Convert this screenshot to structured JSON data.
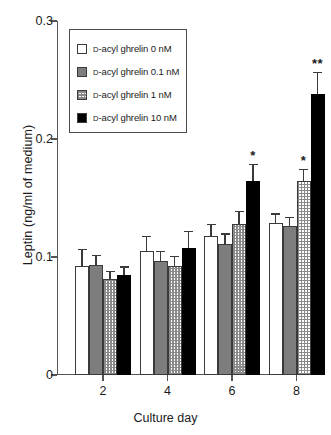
{
  "chart_data": {
    "type": "bar",
    "title": "",
    "xlabel": "Culture day",
    "ylabel": "Leptin (ng/ml of medium)",
    "categories": [
      "2",
      "4",
      "6",
      "8"
    ],
    "ylim": [
      0,
      0.3
    ],
    "yticks": [
      "0",
      "0.1",
      "0.2",
      "0.3"
    ],
    "ytick_values": [
      0,
      0.1,
      0.2,
      0.3
    ],
    "grid": false,
    "legend_position": "upper-left-inside",
    "series": [
      {
        "name": "D-acyl ghrelin 0 nM",
        "fill": "white",
        "values": [
          0.092,
          0.105,
          0.118,
          0.129
        ],
        "errors": [
          0.015,
          0.013,
          0.01,
          0.008
        ],
        "significance": [
          "",
          "",
          "",
          ""
        ]
      },
      {
        "name": "D-acyl ghrelin 0.1 nM",
        "fill": "gray",
        "values": [
          0.093,
          0.097,
          0.111,
          0.126
        ],
        "errors": [
          0.009,
          0.008,
          0.009,
          0.008
        ],
        "significance": [
          "",
          "",
          "",
          ""
        ]
      },
      {
        "name": "D-acyl ghrelin 1 nM",
        "fill": "checker",
        "values": [
          0.081,
          0.092,
          0.128,
          0.164
        ],
        "errors": [
          0.007,
          0.009,
          0.011,
          0.011
        ],
        "significance": [
          "",
          "",
          "",
          "*"
        ]
      },
      {
        "name": "D-acyl ghrelin 10 nM",
        "fill": "black",
        "values": [
          0.085,
          0.108,
          0.164,
          0.238
        ],
        "errors": [
          0.007,
          0.014,
          0.015,
          0.019
        ],
        "significance": [
          "",
          "",
          "*",
          "**"
        ]
      }
    ]
  },
  "legend": {
    "entries": [
      {
        "prefix": "D",
        "label": "-acyl ghrelin 0 nM",
        "swatch": "white"
      },
      {
        "prefix": "D",
        "label": "-acyl ghrelin 0.1 nM",
        "swatch": "gray"
      },
      {
        "prefix": "D",
        "label": "-acyl ghrelin 1 nM",
        "swatch": "checker"
      },
      {
        "prefix": "D",
        "label": "-acyl ghrelin 10 nM",
        "swatch": "black"
      }
    ]
  },
  "axes": {
    "y_label": "Leptin (ng/ml of medium)",
    "x_label": "Culture day",
    "y_tick_labels": [
      "0.3",
      "0.2",
      "0.1",
      "0"
    ],
    "x_tick_labels": [
      "2",
      "4",
      "6",
      "8"
    ]
  },
  "colors": {
    "series_white": "#ffffff",
    "series_gray": "#7d7d7d",
    "series_checker": "#8a8a8a",
    "series_black": "#000000",
    "axis": "#555555",
    "text": "#1a1a1a"
  }
}
